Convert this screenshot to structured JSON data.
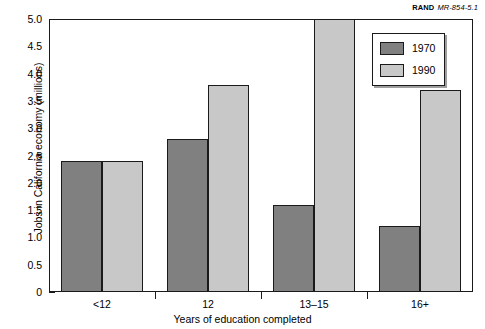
{
  "credit": {
    "org": "RAND",
    "id": "MR-854-5.1"
  },
  "chart_data": {
    "type": "bar",
    "title": "",
    "subtitle": "",
    "xlabel": "Years of education completed",
    "ylabel": "Jobs in California economy (millions)",
    "categories": [
      "<12",
      "12",
      "13–15",
      "16+"
    ],
    "series": [
      {
        "name": "1970",
        "color": "#808080",
        "values": [
          2.4,
          2.8,
          1.6,
          1.2
        ]
      },
      {
        "name": "1990",
        "color": "#c8c8c8",
        "values": [
          2.4,
          3.8,
          5.0,
          3.7
        ]
      }
    ],
    "ylim": [
      0,
      5.0
    ],
    "yticks": [
      "0",
      "0.5",
      "1.0",
      "1.5",
      "2.0",
      "2.5",
      "3.0",
      "3.5",
      "4.0",
      "4.5",
      "5.0"
    ],
    "ytick_values": [
      0,
      0.5,
      1.0,
      1.5,
      2.0,
      2.5,
      3.0,
      3.5,
      4.0,
      4.5,
      5.0
    ],
    "grid": false,
    "legend_position": "top-right",
    "legend": [
      "1970",
      "1990"
    ]
  }
}
